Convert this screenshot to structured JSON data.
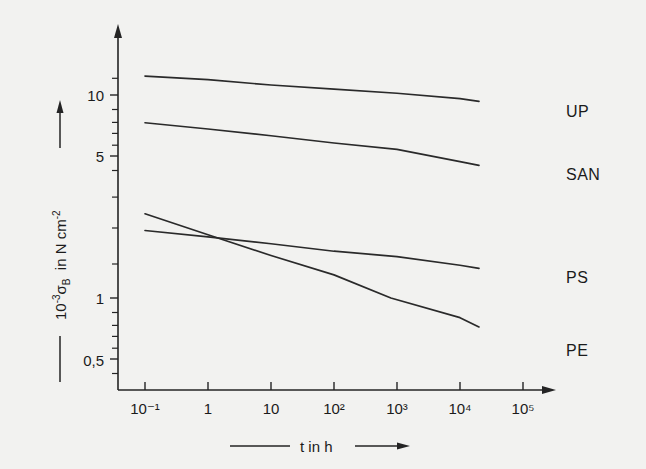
{
  "chart_data": {
    "type": "line",
    "title": "",
    "subtitle": "",
    "xlabel": "t in h",
    "ylabel": "10-3 σB in N cm-2",
    "xscale": "log",
    "yscale": "log",
    "xlim": [
      0.1,
      100000
    ],
    "ylim": [
      0.5,
      20
    ],
    "grid": false,
    "legend_position": "right-of-curves",
    "x_tick_labels": [
      "10⁻¹",
      "1",
      "10",
      "10²",
      "10³",
      "10⁴",
      "10⁵"
    ],
    "x_tick_values": [
      0.1,
      1,
      10,
      100,
      1000,
      10000,
      100000
    ],
    "y_tick_labels": [
      "10",
      "5",
      "1",
      "0,5"
    ],
    "y_tick_values": [
      10,
      5,
      1,
      0.5
    ],
    "series": [
      {
        "name": "UP",
        "label": "UP",
        "x": [
          0.1,
          20000
        ],
        "y": [
          12.4,
          9.3
        ],
        "points": [
          [
            0.1,
            12.4
          ],
          [
            1,
            11.9
          ],
          [
            10,
            11.2
          ],
          [
            100,
            10.7
          ],
          [
            1000,
            10.2
          ],
          [
            10000,
            9.6
          ],
          [
            20000,
            9.3
          ]
        ]
      },
      {
        "name": "SAN",
        "label": "SAN",
        "x": [
          0.1,
          20000
        ],
        "y": [
          7.3,
          4.5
        ],
        "points": [
          [
            0.1,
            7.3
          ],
          [
            1,
            6.8
          ],
          [
            10,
            6.3
          ],
          [
            100,
            5.8
          ],
          [
            1000,
            5.4
          ],
          [
            10000,
            4.7
          ],
          [
            20000,
            4.5
          ]
        ]
      },
      {
        "name": "PS",
        "label": "PS",
        "x": [
          0.1,
          20000
        ],
        "y": [
          2.15,
          1.4
        ],
        "points": [
          [
            0.1,
            2.15
          ],
          [
            1,
            2.0
          ],
          [
            10,
            1.85
          ],
          [
            100,
            1.7
          ],
          [
            1000,
            1.6
          ],
          [
            10000,
            1.45
          ],
          [
            20000,
            1.4
          ]
        ]
      },
      {
        "name": "PE",
        "label": "PE",
        "x": [
          0.1,
          20000
        ],
        "y": [
          2.6,
          0.72
        ],
        "points": [
          [
            0.1,
            2.6
          ],
          [
            1,
            2.05
          ],
          [
            10,
            1.62
          ],
          [
            100,
            1.3
          ],
          [
            800,
            1.0
          ],
          [
            10000,
            0.8
          ],
          [
            20000,
            0.72
          ]
        ]
      }
    ],
    "annotations": {
      "x_axis_arrow": true,
      "y_axis_arrow": true,
      "decimal_separator": "comma"
    },
    "colors": {
      "background": "#f2f2f0",
      "axis": "#242424",
      "curve": "#2a2a2a",
      "text": "#1b1b1b"
    }
  },
  "axes": {
    "y_label_parts": {
      "base": "10",
      "exponent": "-3",
      "symbol": "σ",
      "subscript": "B",
      "connector": "in",
      "unit_base": "N cm",
      "unit_exponent": "-2"
    },
    "x_label_text": "t in h"
  }
}
